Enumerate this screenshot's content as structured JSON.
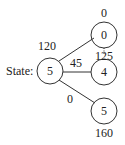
{
  "root": {
    "prefix": "State:",
    "value": "5"
  },
  "children": [
    {
      "value": "0",
      "edge_label": "120",
      "annotation": "0"
    },
    {
      "value": "4",
      "edge_label": "45",
      "annotation": "125"
    },
    {
      "value": "5",
      "edge_label": "0",
      "annotation": "160"
    }
  ],
  "colors": {
    "stroke": "#333333",
    "text": "#222222",
    "background": "#ffffff"
  }
}
